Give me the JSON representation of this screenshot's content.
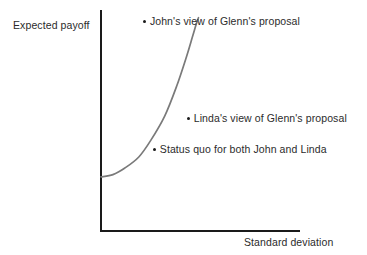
{
  "figure": {
    "background_color": "#ffffff",
    "axis_color": "#1a1a1a",
    "curve_color": "#7a7a7a",
    "text_color": "#2b2b2b"
  },
  "axes": {
    "y_label": "Expected payoff",
    "x_label": "Standard deviation"
  },
  "annotations": {
    "john": "John's view of Glenn's proposal",
    "linda": "Linda's view of Glenn's proposal",
    "status_quo": "Status quo for both John and Linda"
  },
  "chart_data": {
    "type": "scatter",
    "title": "",
    "xlabel": "Standard deviation",
    "ylabel": "Expected payoff",
    "grid": false,
    "legend": "none",
    "axis_ranges": {
      "x": [
        0,
        1
      ],
      "y": [
        0,
        1
      ]
    },
    "tick_labels": {
      "x": [],
      "y": []
    },
    "points": [
      {
        "name": "John's view of Glenn's proposal",
        "label": "John's view of Glenn's proposal",
        "x": 0.22,
        "y": 0.95,
        "on_curve": false,
        "marker": "dot"
      },
      {
        "name": "Linda's view of Glenn's proposal",
        "label": "Linda's view of Glenn's proposal",
        "x": 0.44,
        "y": 0.51,
        "on_curve": false,
        "marker": "dot"
      },
      {
        "name": "Status quo for both John and Linda",
        "label": "Status quo for both John and Linda",
        "x": 0.27,
        "y": 0.37,
        "on_curve": true,
        "marker": "dot"
      }
    ],
    "series": [
      {
        "name": "indifference / frontier curve",
        "type": "line",
        "color": "#7a7a7a",
        "style": "solid",
        "x": [
          0.0,
          0.06,
          0.12,
          0.19,
          0.25,
          0.32,
          0.38,
          0.43,
          0.46,
          0.48,
          0.49
        ],
        "y": [
          0.245,
          0.255,
          0.285,
          0.335,
          0.41,
          0.52,
          0.655,
          0.79,
          0.88,
          0.94,
          0.965
        ]
      }
    ]
  }
}
